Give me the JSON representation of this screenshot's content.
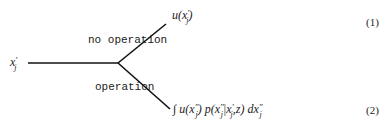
{
  "diagram": {
    "root_node": {
      "label": "x",
      "prime": "'",
      "subscript": "j"
    },
    "branches": [
      {
        "label": "no operation",
        "outcome": "u(x'j)",
        "outcome_parts": {
          "func": "u(",
          "var": "x",
          "prime": "'",
          "subscript": "j",
          "close": ")"
        },
        "equation_number": "(1)"
      },
      {
        "label": "operation",
        "outcome": "∫ u(x\"j) p(x\"j|x'j,z) dx\"j",
        "outcome_parts": {
          "integral": "∫",
          "u_open": "u(",
          "x1": "x",
          "x1_prime": "\"",
          "x1_sub": "j",
          "u_close": ")",
          "p_open": "p(",
          "x2": "x",
          "x2_prime": "\"",
          "x2_sub": "j",
          "bar": "|",
          "x3": "x",
          "x3_prime": "'",
          "x3_sub": "j",
          "z_part": ",z)",
          "d": "dx",
          "d_prime": "\"",
          "d_sub": "j"
        },
        "equation_number": "(2)"
      }
    ],
    "line_color": "#111111"
  }
}
